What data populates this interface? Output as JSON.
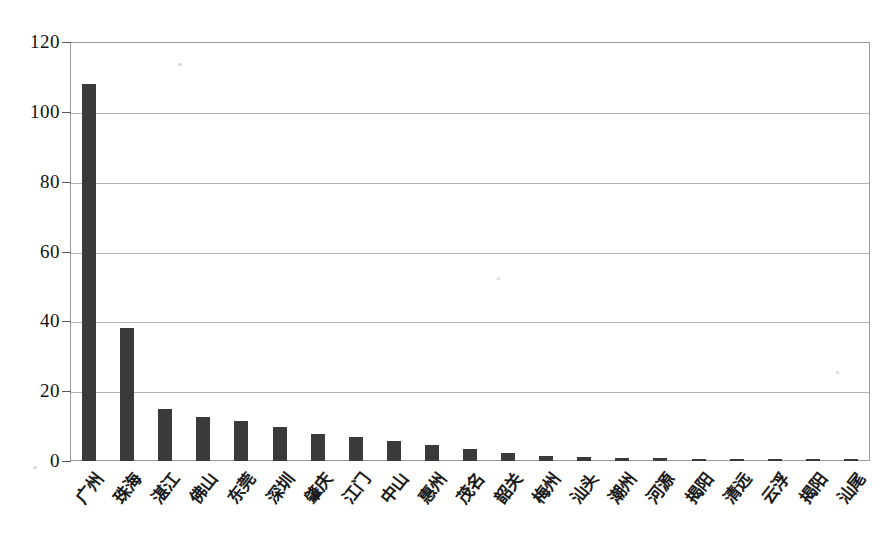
{
  "chart_data": {
    "type": "bar",
    "title": "",
    "subtitle": "",
    "xlabel": "",
    "ylabel": "",
    "ylim": [
      0,
      120
    ],
    "ytick_step": 20,
    "ytick_labels": [
      "0",
      "20",
      "40",
      "60",
      "80",
      "100",
      "120"
    ],
    "grid": true,
    "legend": "none",
    "bar_color": "#3a3a3a",
    "categories": [
      "广州",
      "珠海",
      "湛江",
      "佛山",
      "东莞",
      "深圳",
      "肇庆",
      "江门",
      "中山",
      "惠州",
      "茂名",
      "韶关",
      "梅州",
      "汕头",
      "潮州",
      "河源",
      "揭阳",
      "清远",
      "云浮",
      "揭阳",
      "汕尾"
    ],
    "values": [
      108,
      38,
      15,
      12.5,
      11.5,
      9.8,
      7.8,
      6.8,
      5.8,
      4.5,
      3.3,
      2.2,
      1.3,
      1.1,
      1.0,
      0.9,
      0.5,
      0.45,
      0.4,
      0.35,
      0.5
    ]
  },
  "axis": {
    "y_title": "",
    "x_title": ""
  }
}
